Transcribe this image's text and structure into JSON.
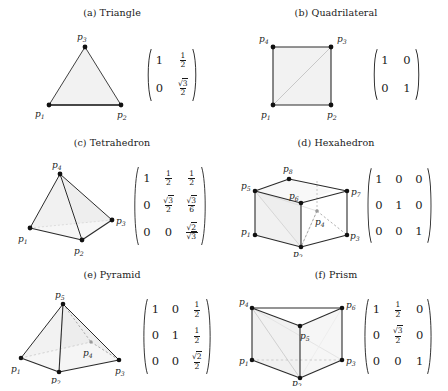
{
  "figure": {
    "title": "",
    "panels": [
      {
        "id": "triangle",
        "caption": "(a) Triangle",
        "shape_type": "triangle",
        "dimension": "2D",
        "vertex_labels": [
          "p1",
          "p2",
          "p3"
        ],
        "matrix": {
          "rows": 2,
          "cols": 2,
          "entries": [
            [
              "1",
              "1/2"
            ],
            [
              "0",
              "sqrt(3)/2"
            ]
          ]
        }
      },
      {
        "id": "quadrilateral",
        "caption": "(b) Quadrilateral",
        "shape_type": "square",
        "dimension": "2D",
        "vertex_labels": [
          "p1",
          "p2",
          "p3",
          "p4"
        ],
        "matrix": {
          "rows": 2,
          "cols": 2,
          "entries": [
            [
              "1",
              "0"
            ],
            [
              "0",
              "1"
            ]
          ]
        }
      },
      {
        "id": "tetrahedron",
        "caption": "(c) Tetrahedron",
        "shape_type": "tetrahedron",
        "dimension": "3D",
        "vertex_labels": [
          "p1",
          "p2",
          "p3",
          "p4"
        ],
        "matrix": {
          "rows": 3,
          "cols": 3,
          "entries": [
            [
              "1",
              "1/2",
              "1/2"
            ],
            [
              "0",
              "sqrt(3)/2",
              "sqrt(3)/6"
            ],
            [
              "0",
              "0",
              "sqrt(2)/sqrt(3)"
            ]
          ]
        }
      },
      {
        "id": "hexahedron",
        "caption": "(d) Hexahedron",
        "shape_type": "cube",
        "dimension": "3D",
        "vertex_labels": [
          "p1",
          "p2",
          "p3",
          "p4",
          "p5",
          "p6",
          "p7",
          "p8"
        ],
        "matrix": {
          "rows": 3,
          "cols": 3,
          "entries": [
            [
              "1",
              "0",
              "0"
            ],
            [
              "0",
              "1",
              "0"
            ],
            [
              "0",
              "0",
              "1"
            ]
          ]
        }
      },
      {
        "id": "pyramid",
        "caption": "(e) Pyramid",
        "shape_type": "square-pyramid",
        "dimension": "3D",
        "vertex_labels": [
          "p1",
          "p2",
          "p3",
          "p4",
          "p5"
        ],
        "matrix": {
          "rows": 3,
          "cols": 3,
          "entries": [
            [
              "1",
              "0",
              "1/2"
            ],
            [
              "0",
              "1",
              "1/2"
            ],
            [
              "0",
              "0",
              "sqrt(2)/2"
            ]
          ]
        }
      },
      {
        "id": "prism",
        "caption": "(f) Prism",
        "shape_type": "triangular-prism",
        "dimension": "3D",
        "vertex_labels": [
          "p1",
          "p2",
          "p3",
          "p4",
          "p5",
          "p6"
        ],
        "matrix": {
          "rows": 3,
          "cols": 3,
          "entries": [
            [
              "1",
              "1/2",
              "0"
            ],
            [
              "0",
              "sqrt(3)/2",
              "0"
            ],
            [
              "0",
              "0",
              "1"
            ]
          ]
        }
      }
    ]
  },
  "colors": {
    "ink": "#1a1a1a",
    "edge": "#2b2b2b",
    "hidden_edge": "#9a9a9a",
    "face_fill": "#f2f2f2",
    "background": "#ffffff"
  }
}
